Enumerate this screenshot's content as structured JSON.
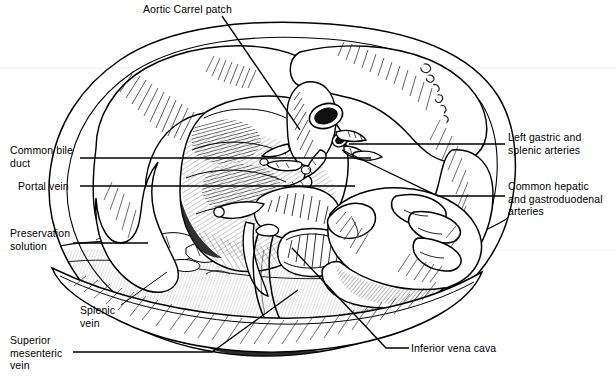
{
  "figure": {
    "kind": "medical-line-illustration",
    "style": "black-and-white pen-and-ink hatched line drawing",
    "background_color": "#ffffff",
    "ink_color": "#000000",
    "width": 616,
    "height": 376,
    "signature": "artist signature"
  },
  "labels": [
    {
      "id": "aortic-carrel-patch",
      "text": "Aortic Carrel patch",
      "side": "top",
      "x": 143,
      "y": 3,
      "leader": {
        "type": "diagonal",
        "points": "222,16 300,130"
      }
    },
    {
      "id": "common-bile-duct",
      "text": "Common bile\nduct",
      "side": "left",
      "x": 10,
      "y": 144,
      "leader": {
        "type": "horizontal",
        "points": "80,158 371,158"
      }
    },
    {
      "id": "portal-vein",
      "text": "Portal vein",
      "side": "left",
      "x": 18,
      "y": 180,
      "leader": {
        "type": "horizontal",
        "points": "80,186 355,186"
      }
    },
    {
      "id": "preservation-solution",
      "text": "Preservation\nsolution",
      "side": "left",
      "x": 10,
      "y": 227,
      "leader": {
        "type": "horizontal",
        "points": "73,243 148,243"
      }
    },
    {
      "id": "splenic-vein",
      "text": "Splenic\nvein",
      "side": "left",
      "x": 80,
      "y": 304,
      "leader": {
        "type": "diagonal",
        "points": "121,305 167,272"
      }
    },
    {
      "id": "superior-mesenteric-vein",
      "text": "Superior\nmesenteric\nvein",
      "side": "left",
      "x": 10,
      "y": 334,
      "leader": {
        "type": "horizontal-then-diagonal",
        "points": "73,352 212,352 298,290"
      }
    },
    {
      "id": "left-gastric-and-splenic-arteries",
      "text": "Left gastric and\nsplenic arteries",
      "side": "right",
      "x": 508,
      "y": 131,
      "leader": {
        "type": "horizontal",
        "points": "505,144 349,144"
      }
    },
    {
      "id": "common-hepatic-and-gastroduodenal-arteries",
      "text": "Common hepatic\nand gastroduodenal\narteries",
      "side": "right",
      "x": 508,
      "y": 180,
      "leader": {
        "type": "horizontal-then-diagonal",
        "points": "505,196 438,196 342,150"
      }
    },
    {
      "id": "inferior-vena-cava",
      "text": "Inferior vena cava",
      "side": "bottom-right",
      "x": 411,
      "y": 342,
      "leader": {
        "type": "horizontal-then-diagonal",
        "points": "409,348 386,348 292,248"
      }
    }
  ]
}
